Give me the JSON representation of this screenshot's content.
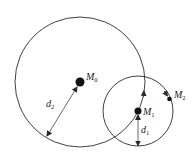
{
  "diagram": {
    "colors": {
      "stroke": "#2a2a2a",
      "background": "#ffffff"
    },
    "circles": [
      {
        "id": "big",
        "cx": 80,
        "cy": 82,
        "r": 65
      },
      {
        "id": "small",
        "cx": 138,
        "cy": 111,
        "r": 35
      }
    ],
    "points": [
      {
        "id": "M0",
        "base": "M",
        "sub": "0",
        "x": 80,
        "y": 82,
        "size": 4.5
      },
      {
        "id": "M1",
        "base": "M",
        "sub": "1",
        "x": 138,
        "y": 111,
        "size": 3.5
      },
      {
        "id": "M2",
        "base": "M",
        "sub": "2",
        "x": 169,
        "y": 99,
        "size": 2.5
      }
    ],
    "dimensions": [
      {
        "id": "d2",
        "base": "d",
        "sub": "2",
        "from": [
          76,
          88
        ],
        "to": [
          47,
          136
        ]
      },
      {
        "id": "d1",
        "base": "d",
        "sub": "1",
        "from": [
          138,
          116
        ],
        "to": [
          138,
          145
        ]
      }
    ],
    "labels": {
      "M0": {
        "base": "M",
        "sub": "0"
      },
      "M1": {
        "base": "M",
        "sub": "1"
      },
      "M2": {
        "base": "M",
        "sub": "2"
      },
      "d1": {
        "base": "d",
        "sub": "1"
      },
      "d2": {
        "base": "d",
        "sub": "2"
      }
    }
  }
}
